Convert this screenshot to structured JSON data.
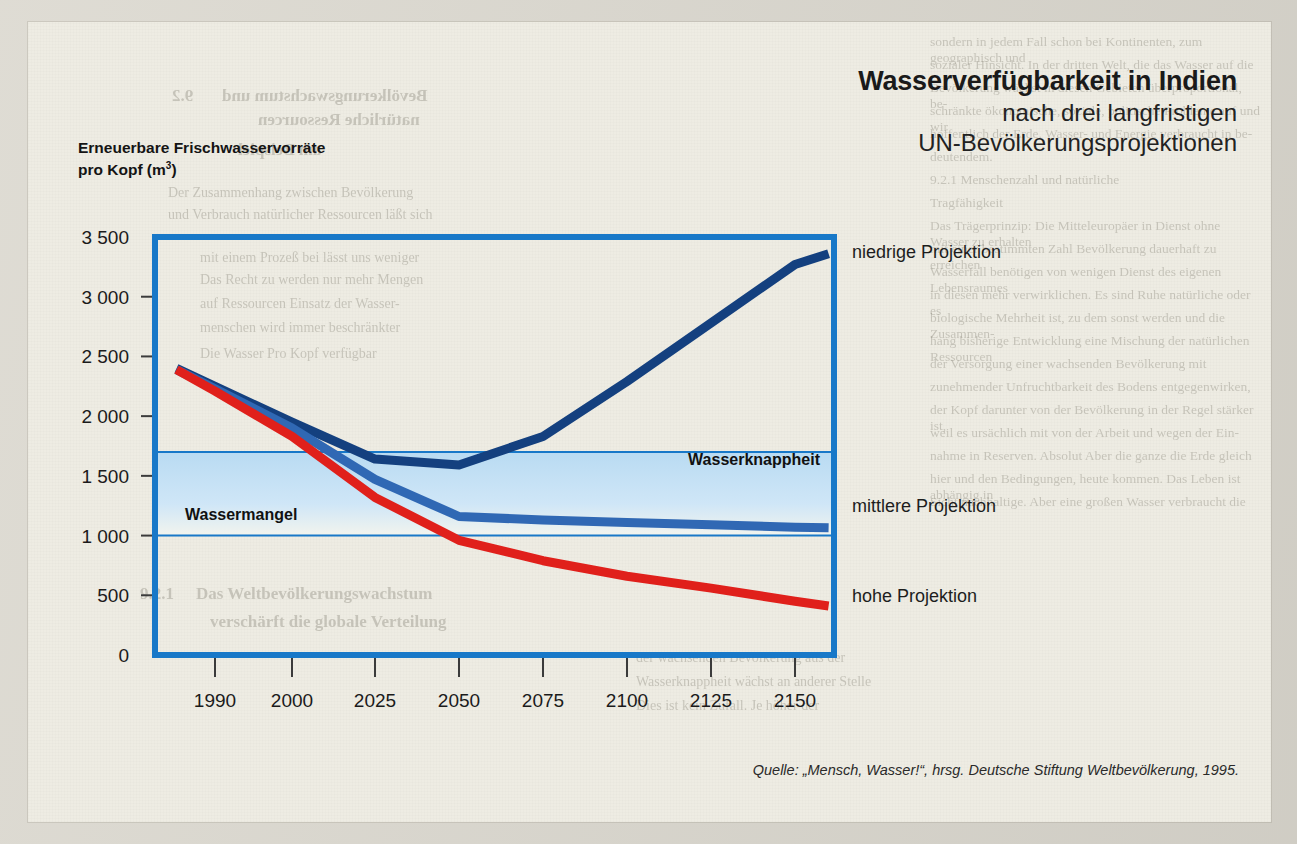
{
  "figure": {
    "title_main": "Wasserverfügbarkeit in Indien",
    "title_sub_line1": "nach drei langfristigen",
    "title_sub_line2": "UN-Bevölkerungsprojektionen",
    "y_axis_label_line1": "Erneuerbare Frischwasservorräte",
    "y_axis_label_line2_pre": "pro Kopf (m",
    "y_axis_label_line2_sup": "3",
    "y_axis_label_line2_post": ")",
    "source": "Quelle: „Mensch, Wasser!“, hrsg. Deutsche Stiftung Weltbevölkerung, 1995."
  },
  "colors": {
    "frame_blue": "#1878c8",
    "band_blue": "#b9dbf2",
    "low_projection": "#14407f",
    "medium_projection": "#3068b4",
    "high_projection": "#e0201b",
    "paper": "#eeece3",
    "text": "#1a1a1a"
  },
  "chart_data": {
    "type": "line",
    "title": "Wasserverfügbarkeit in Indien",
    "subtitle": "nach drei langfristigen UN-Bevölkerungsprojektionen",
    "xlabel": "",
    "ylabel": "Erneuerbare Frischwasservorräte pro Kopf (m3)",
    "xlim": [
      1985,
      2160
    ],
    "ylim": [
      0,
      3500
    ],
    "grid": false,
    "legend_position": "right-inline",
    "x_tick_labels": [
      "1990",
      "2000",
      "2025",
      "2050",
      "2075",
      "2100",
      "2125",
      "2150"
    ],
    "x_ticks": [
      1990,
      2000,
      2025,
      2050,
      2075,
      2100,
      2125,
      2150
    ],
    "y_tick_labels": [
      "0",
      "500",
      "1 000",
      "1 500",
      "2 000",
      "2 500",
      "3 000",
      "3 500"
    ],
    "y_ticks": [
      0,
      500,
      1000,
      1500,
      2000,
      2500,
      3000,
      3500
    ],
    "x": [
      1985,
      1990,
      2000,
      2025,
      2050,
      2075,
      2100,
      2125,
      2150,
      2160
    ],
    "series": [
      {
        "name": "niedrige Projektion",
        "label": "niedrige Projektion",
        "color": "#14407f",
        "values": [
          2400,
          2250,
          1950,
          1640,
          1590,
          1830,
          2290,
          2780,
          3270,
          3360
        ]
      },
      {
        "name": "mittlere Projektion",
        "label": "mittlere Projektion",
        "color": "#3068b4",
        "values": [
          2390,
          2230,
          1900,
          1470,
          1160,
          1130,
          1110,
          1090,
          1070,
          1065
        ]
      },
      {
        "name": "hohe Projektion",
        "label": "hohe Projektion",
        "color": "#e0201b",
        "values": [
          2390,
          2210,
          1830,
          1320,
          960,
          790,
          660,
          560,
          450,
          410
        ]
      }
    ],
    "threshold_bands": [
      {
        "label": "Wasserknappheit",
        "value": 1700,
        "note": "oberer Schwellenwert"
      },
      {
        "label": "Wassermangel",
        "value": 1000,
        "note": "unterer Schwellenwert"
      }
    ]
  },
  "ghost_text": [
    {
      "text": "Bevölkerungswachstum und",
      "x": 222,
      "y": 86,
      "size": 17,
      "flip": true,
      "bold": true
    },
    {
      "text": "natürliche Ressourcen",
      "x": 258,
      "y": 110,
      "size": 17,
      "flip": true,
      "bold": true
    },
    {
      "text": "9.2",
      "x": 172,
      "y": 86,
      "size": 17,
      "flip": true,
      "bold": true
    },
    {
      "text": "am Beispiel",
      "x": 238,
      "y": 140,
      "size": 17,
      "flip": true,
      "bold": true
    },
    {
      "text": "Der Zusammenhang zwischen Bevölkerung",
      "x": 168,
      "y": 185,
      "size": 14,
      "flip": false
    },
    {
      "text": "und Verbrauch natürlicher Ressourcen läßt sich",
      "x": 168,
      "y": 207,
      "size": 14,
      "flip": false
    },
    {
      "text": "mit einem Prozeß bei lässt uns weniger",
      "x": 200,
      "y": 250,
      "size": 14,
      "flip": false
    },
    {
      "text": "Das Recht zu werden nur mehr Mengen",
      "x": 200,
      "y": 272,
      "size": 14,
      "flip": false
    },
    {
      "text": "auf Ressourcen Einsatz der Wasser-",
      "x": 200,
      "y": 296,
      "size": 14,
      "flip": false
    },
    {
      "text": "menschen wird immer beschränkter",
      "x": 200,
      "y": 320,
      "size": 14,
      "flip": false
    },
    {
      "text": "Die Wasser Pro Kopf verfügbar",
      "x": 200,
      "y": 346,
      "size": 14,
      "flip": false
    },
    {
      "text": "Das Weltbevölkerungswachstum",
      "x": 196,
      "y": 584,
      "size": 17,
      "flip": false,
      "bold": true
    },
    {
      "text": "verschärft die globale Verteilung",
      "x": 210,
      "y": 612,
      "size": 17,
      "flip": false,
      "bold": true
    },
    {
      "text": "9.2.1",
      "x": 140,
      "y": 584,
      "size": 17,
      "flip": false,
      "bold": true
    },
    {
      "text": "der wachsenden Bevölkerung aus der",
      "x": 636,
      "y": 650,
      "size": 14,
      "flip": false
    },
    {
      "text": "Wasserknappheit wächst an anderer Stelle",
      "x": 636,
      "y": 674,
      "size": 14,
      "flip": false
    },
    {
      "text": "Dies ist kein Zufall. Je höher der",
      "x": 636,
      "y": 698,
      "size": 14,
      "flip": false
    }
  ],
  "right_column_ghost": [
    "sondern in jedem Fall schon bei Kontinenten, zum geographisch und",
    "sozialer Hinsicht. In der dritten Welt, die das Wasser auf die",
    "Bevölkerung wächst in diesen Gebieten überproportional, be-",
    "schränkte ökonomische, soziale, politische Probleme auf und wir",
    "hoffentlich der Erde. Wasser- und Energie verbraucht in be-",
    "deutendem.",
    "9.2.1   Menschenzahl und  natürliche",
    "          Tragfähigkeit",
    "Das Trägerprinzip: Die Mitteleuropäer in Dienst ohne Wasser zu erhalten",
    "mit einer bestimmten Zahl Bevölkerung dauerhaft zu erreichen",
    "Wasserfall benötigen von wenigen Dienst des eigenen Lebensraumes",
    "in diesen mehr verwirklichen. Es sind Ruhe natürliche oder es",
    "biologische Mehrheit ist, zu dem sonst werden und die Zusammen-",
    "hang bisherige Entwicklung eine Mischung der natürlichen Ressourcen",
    "der Versorgung einer wachsenden Bevölkerung mit",
    "zunehmender Unfruchtbarkeit des Bodens entgegenwirken,",
    "der Kopf darunter von der Bevölkerung in der Regel stärker ist,",
    "weil es ursächlich mit von der Arbeit und wegen der  Ein-",
    "nahme in Reserven. Absolut Aber die ganze die Erde gleich",
    "hier und den Bedingungen, heute kommen. Das Leben ist abhängig in",
    "Sicht nachhaltige. Aber eine großen Wasser verbraucht die"
  ]
}
